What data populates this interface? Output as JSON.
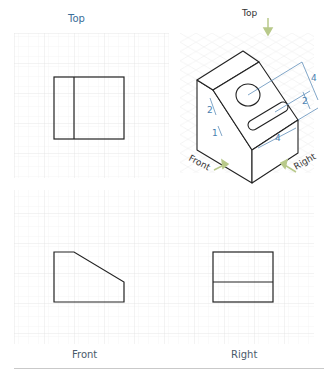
{
  "views": {
    "top": {
      "label": "Top"
    },
    "front": {
      "label": "Front"
    },
    "right": {
      "label": "Right"
    }
  },
  "isometric": {
    "labels": {
      "top": "Top",
      "front": "Front",
      "right": "Right"
    },
    "dimensions": {
      "overall_height": "4",
      "slot_offset": "2",
      "hole_offset": "2",
      "slot_width": "1",
      "slot_length": "4"
    }
  },
  "colors": {
    "grid_line": "#eeeeee",
    "grid_major": "#e4e4e4",
    "outline": "#222222",
    "dimension": "#4a7fb0",
    "arrow": "#b8c98a",
    "label": "#3b6e99"
  }
}
